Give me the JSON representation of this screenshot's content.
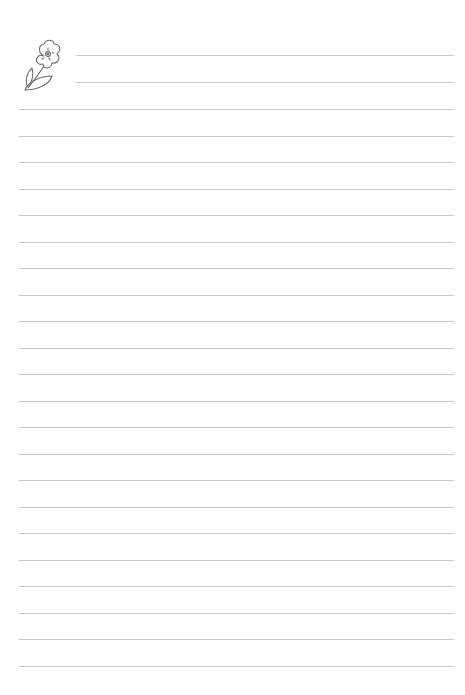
{
  "page": {
    "type": "lined-writing-paper",
    "background": "#ffffff",
    "line_color": "#c9c9c9"
  },
  "decoration": {
    "icon": "flower-icon",
    "stroke_color": "#6f6f6f"
  },
  "header_lines": {
    "count": 2,
    "x_start": 76,
    "x_end": 454,
    "y": [
      55,
      82
    ]
  },
  "body_lines": {
    "count": 22,
    "x_start": 19,
    "x_end": 454,
    "y_start": 109,
    "spacing": 26.5
  }
}
